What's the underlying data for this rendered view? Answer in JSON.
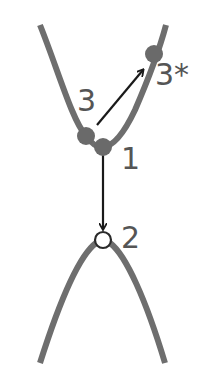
{
  "diagram": {
    "colors": {
      "curve": "#6e6e6e",
      "point_fill": "#6a6a6a",
      "arrow": "#1a1a1a",
      "label": "#555555",
      "open_point_fill": "#ffffff"
    },
    "upper_curve": {
      "shape": "V-shaped parabola (opens upward)"
    },
    "lower_curve": {
      "shape": "inverted parabola (opens downward)"
    },
    "points": [
      {
        "id": "1",
        "label": "1",
        "type": "filled"
      },
      {
        "id": "2",
        "label": "2",
        "type": "open"
      },
      {
        "id": "3",
        "label": "3",
        "type": "filled"
      },
      {
        "id": "3star",
        "label": "3*",
        "type": "filled"
      }
    ],
    "arrows": [
      {
        "from": "3",
        "to": "3*"
      },
      {
        "from": "1",
        "to": "2"
      }
    ]
  }
}
